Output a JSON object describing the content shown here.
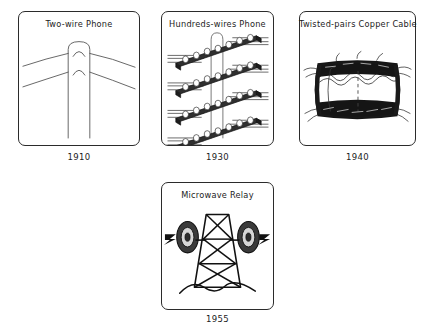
{
  "figure": {
    "background_color": "#ffffff",
    "line_color": "#2b2b2b"
  },
  "panels": [
    {
      "id": "two-wire-phone",
      "title": "Two-wire Phone",
      "year": "1910",
      "illustration": "utility pole with two open wires on insulators"
    },
    {
      "id": "hundreds-wires-phone",
      "title": "Hundreds-wires Phone",
      "year": "1930",
      "illustration": "pole with four crossarms carrying many insulated wires"
    },
    {
      "id": "twisted-pairs-copper-cable",
      "title": "Twisted-pairs Copper Cable",
      "year": "1940",
      "illustration": "cut-away cylindrical copper cable bundle of twisted pairs"
    },
    {
      "id": "microwave-relay",
      "title": "Microwave Relay",
      "year": "1955",
      "illustration": "lattice tower with two parabolic dish antennas radiating signals"
    }
  ]
}
